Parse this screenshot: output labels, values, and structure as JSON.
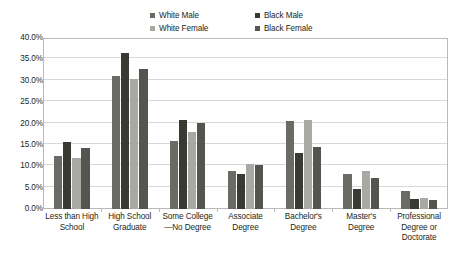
{
  "chart_data": {
    "type": "bar",
    "title": "",
    "subtitle": "",
    "xlabel": "",
    "ylabel": "",
    "ylim": [
      0,
      40
    ],
    "ytick_values": [
      0,
      5,
      10,
      15,
      20,
      25,
      30,
      35,
      40
    ],
    "ytick_labels": [
      "0.0%",
      "5.0%",
      "10.0%",
      "15.0%",
      "20.0%",
      "25.0%",
      "30.0%",
      "35.0%",
      "40.0%"
    ],
    "grid": true,
    "legend_position": "top-center",
    "categories": [
      "Less than High School",
      "High School Graduate",
      "Some College —No Degree",
      "Associate Degree",
      "Bachelor's Degree",
      "Master's Degree",
      "Professional Degree or Doctorate"
    ],
    "category_lines": [
      [
        "Less than High",
        "School"
      ],
      [
        "High School",
        "Graduate"
      ],
      [
        "Some College",
        "—No Degree"
      ],
      [
        "Associate",
        "Degree"
      ],
      [
        "Bachelor's",
        "Degree"
      ],
      [
        "Master's",
        "Degree"
      ],
      [
        "Professional",
        "Degree or",
        "Doctorate"
      ]
    ],
    "series": [
      {
        "name": "White Male",
        "color": "#6b6b66",
        "values": [
          12.3,
          31.0,
          16.0,
          9.0,
          20.7,
          8.2,
          4.3
        ]
      },
      {
        "name": "Black Male",
        "color": "#3a3a34",
        "values": [
          15.7,
          36.5,
          20.8,
          8.2,
          13.0,
          4.6,
          2.4
        ]
      },
      {
        "name": "White Female",
        "color": "#a9a9a4",
        "values": [
          12.0,
          30.3,
          18.0,
          10.5,
          20.8,
          9.0,
          2.5
        ]
      },
      {
        "name": "Black Female",
        "color": "#55554f",
        "values": [
          14.2,
          32.7,
          20.1,
          10.3,
          14.4,
          7.3,
          2.1
        ]
      }
    ],
    "legend_order": [
      "White Male",
      "Black Male",
      "White Female",
      "Black Female"
    ]
  },
  "style": {
    "frame_border": "#b9b9b9",
    "gridline": "#d8d8d8",
    "text": "#231f20",
    "background": "#ffffff"
  }
}
